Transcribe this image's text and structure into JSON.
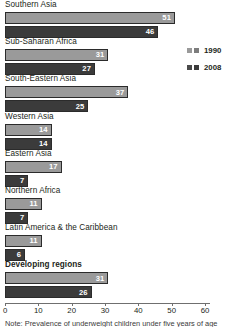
{
  "chart_data": {
    "type": "bar",
    "orientation": "horizontal",
    "title": "",
    "xlabel": "",
    "ylabel": "",
    "xlim": [
      0,
      60
    ],
    "xticks": [
      0,
      10,
      20,
      30,
      40,
      50,
      60
    ],
    "grid": false,
    "legend_position": "right",
    "categories": [
      "Southern Asia",
      "Sub-Saharan Africa",
      "South-Eastern Asia",
      "Western Asia",
      "Eastern Asia",
      "Northern Africa",
      "Latin America & the Caribbean",
      "Developing regions"
    ],
    "emphasized_categories": [
      "Developing regions"
    ],
    "series": [
      {
        "name": "1990",
        "color": "#9a9a9a",
        "values": [
          51,
          31,
          37,
          14,
          17,
          11,
          11,
          31
        ]
      },
      {
        "name": "2008",
        "color": "#3b3b3b",
        "values": [
          46,
          27,
          25,
          14,
          7,
          7,
          6,
          26
        ]
      }
    ]
  },
  "legend": {
    "items": [
      {
        "label": "1990",
        "color": "#9a9a9a"
      },
      {
        "label": "2008",
        "color": "#3b3b3b"
      }
    ]
  },
  "axis": {
    "ticks": [
      "0",
      "10",
      "20",
      "30",
      "40",
      "50",
      "60"
    ]
  },
  "note": {
    "text": "Note: Prevalence of underweight children under five years of age"
  }
}
